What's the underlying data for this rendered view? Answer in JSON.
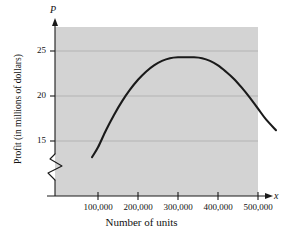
{
  "chart_data": {
    "type": "line",
    "title": "",
    "xlabel": "Number of units",
    "ylabel": "Profit (in millions of dollars)",
    "x_axis_variable": "x",
    "y_axis_variable": "P",
    "xlim": [
      0,
      570000
    ],
    "ylim": [
      13.2,
      26.4
    ],
    "y_axis_broken": true,
    "grid": true,
    "grid_orientation": "horizontal",
    "legend": "none",
    "plot_background": "#d3d3d3",
    "curve_color": "#1a1a1a",
    "gridline_color": "#b0b0b0",
    "xticks": [
      {
        "value": 100000,
        "label": "100,000"
      },
      {
        "value": 200000,
        "label": "200,000"
      },
      {
        "value": 300000,
        "label": "300,000"
      },
      {
        "value": 400000,
        "label": "400,000"
      },
      {
        "value": 500000,
        "label": "500,000"
      }
    ],
    "yticks": [
      {
        "value": 15,
        "label": "15"
      },
      {
        "value": 20,
        "label": "20"
      },
      {
        "value": 25,
        "label": "25"
      }
    ],
    "series": [
      {
        "name": "Profit",
        "points": [
          [
            85000,
            13.2
          ],
          [
            100000,
            14.3
          ],
          [
            120000,
            16.2
          ],
          [
            140000,
            17.9
          ],
          [
            160000,
            19.4
          ],
          [
            180000,
            20.7
          ],
          [
            200000,
            21.8
          ],
          [
            220000,
            22.7
          ],
          [
            240000,
            23.4
          ],
          [
            260000,
            23.9
          ],
          [
            280000,
            24.2
          ],
          [
            300000,
            24.3
          ],
          [
            320000,
            24.3
          ],
          [
            340000,
            24.3
          ],
          [
            360000,
            24.2
          ],
          [
            380000,
            23.9
          ],
          [
            400000,
            23.4
          ],
          [
            420000,
            22.7
          ],
          [
            440000,
            21.9
          ],
          [
            460000,
            20.9
          ],
          [
            480000,
            19.8
          ],
          [
            500000,
            18.6
          ],
          [
            520000,
            17.4
          ],
          [
            545000,
            16.2
          ]
        ]
      }
    ]
  }
}
